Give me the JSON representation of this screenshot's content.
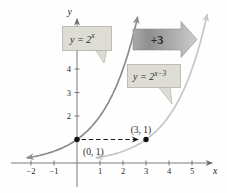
{
  "chart_data": {
    "type": "line",
    "title": "",
    "axes": {
      "x_label": "x",
      "y_label": "y",
      "x_range": [
        -2.6,
        6.1
      ],
      "y_range": [
        0,
        6.3
      ],
      "grid": false,
      "x_ticks": [
        {
          "v": -2,
          "label": "−2"
        },
        {
          "v": -1,
          "label": "−1"
        },
        {
          "v": 1,
          "label": "1"
        },
        {
          "v": 2,
          "label": "2"
        },
        {
          "v": 3,
          "label": "3"
        },
        {
          "v": 4,
          "label": "4"
        },
        {
          "v": 5,
          "label": "5"
        }
      ],
      "y_ticks": [
        {
          "v": 1,
          "label": ""
        },
        {
          "v": 2,
          "label": "2"
        },
        {
          "v": 3,
          "label": "3"
        },
        {
          "v": 4,
          "label": "4"
        },
        {
          "v": 5,
          "label": "5"
        }
      ]
    },
    "series": [
      {
        "name": "y = 2^x",
        "base": 2,
        "shift": 0,
        "color": "#8a8c8e",
        "x_sample_range": [
          -2.18,
          2.635
        ]
      },
      {
        "name": "y = 2^(x-3)",
        "base": 2,
        "shift": 3,
        "color": "#c5c6c5",
        "x_sample_range": [
          0.82,
          5.66
        ]
      }
    ],
    "points": [
      {
        "x": 0,
        "y": 1,
        "label": "(0, 1)",
        "label_dx": 6,
        "label_dy": 15,
        "label_anchor": "start"
      },
      {
        "x": 3,
        "y": 1,
        "label": "(3, 1)",
        "label_dx": -5,
        "label_dy": -7,
        "label_anchor": "middle"
      }
    ],
    "shift_arrow": {
      "label": "+3",
      "from": [
        0,
        1
      ],
      "to": [
        3,
        1
      ]
    },
    "annotations": {
      "curve1": {
        "base": "y = 2",
        "exp": "x"
      },
      "curve2": {
        "base": "y = 2",
        "exp": "x−3"
      }
    },
    "colors": {
      "axis": "#6b6b6b",
      "text": "#2a2a2a",
      "point": "#111111",
      "callout_fill": "#deddd5",
      "callout_border": "#b3b1a6",
      "block_arrow_dark": "#8f8f8f",
      "block_arrow_light": "#c9c9c9",
      "dashed_arrow": "#1a1a1a"
    },
    "layout": {
      "x0_px": 77,
      "y0_px": 163,
      "px_per_unit_x": 23,
      "px_per_unit_y": 23.5,
      "curve_stroke_width": 1.7
    }
  }
}
